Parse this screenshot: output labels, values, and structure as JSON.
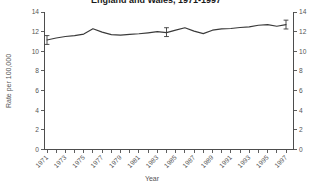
{
  "chart_data": {
    "type": "line",
    "title": "England and Wales, 1971-1997",
    "title_clipped_at_top": true,
    "xlabel": "Year",
    "ylabel": "Rate per 100,000",
    "x": [
      1971,
      1972,
      1973,
      1974,
      1975,
      1976,
      1977,
      1978,
      1979,
      1980,
      1981,
      1982,
      1983,
      1984,
      1985,
      1986,
      1987,
      1988,
      1989,
      1990,
      1991,
      1992,
      1993,
      1994,
      1995,
      1996,
      1997
    ],
    "values": [
      11.15,
      11.35,
      11.5,
      11.6,
      11.75,
      12.3,
      11.95,
      11.7,
      11.65,
      11.72,
      11.78,
      11.88,
      12.0,
      11.9,
      12.15,
      12.4,
      12.05,
      11.8,
      12.15,
      12.28,
      12.32,
      12.42,
      12.48,
      12.65,
      12.72,
      12.55,
      12.72
    ],
    "error_bars": [
      {
        "x": 1971,
        "y": 11.15,
        "err": 0.45
      },
      {
        "x": 1984,
        "y": 11.95,
        "err": 0.45
      },
      {
        "x": 1997,
        "y": 12.72,
        "err": 0.45
      }
    ],
    "ylim": [
      0,
      14
    ],
    "yticks": [
      0,
      2,
      4,
      6,
      8,
      10,
      12,
      14
    ],
    "ytick_labels": [
      "0",
      "2",
      "4",
      "6",
      "8",
      "10",
      "12",
      "14"
    ],
    "xlim": [
      1970.7,
      1997.9
    ],
    "xticks": [
      1971,
      1972,
      1973,
      1974,
      1975,
      1976,
      1977,
      1978,
      1979,
      1980,
      1981,
      1982,
      1983,
      1984,
      1985,
      1986,
      1987,
      1988,
      1989,
      1990,
      1991,
      1992,
      1993,
      1994,
      1995,
      1996,
      1997
    ],
    "xtick_labels": [
      "1971",
      "",
      "1973",
      "",
      "1975",
      "",
      "1977",
      "",
      "1979",
      "",
      "1981",
      "",
      "1983",
      "",
      "1985",
      "",
      "1987",
      "",
      "1989",
      "",
      "1991",
      "",
      "1993",
      "",
      "1995",
      "",
      "1997"
    ],
    "right_axis_mirrored": true,
    "right_ytick_labels": [
      "0",
      "2",
      "4",
      "6",
      "8",
      "10",
      "12",
      "14"
    ],
    "grid": false,
    "legend": null,
    "colors": {
      "line": "#3a3a3a",
      "axis": "#4d4d4d",
      "text": "#555555",
      "title": "#1a1a1a",
      "background": "#ffffff"
    }
  }
}
